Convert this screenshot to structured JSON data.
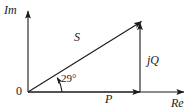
{
  "figure": {
    "type": "phasor-diagram",
    "background_color": "#ffffff",
    "line_color": "#1a1a1a",
    "axes": {
      "vertical_label": "Im",
      "horizontal_label": "Re",
      "origin_label": "0"
    },
    "vectors": [
      {
        "name": "apparent-power",
        "label": "S",
        "from": [
          28,
          92
        ],
        "to": [
          142,
          22
        ],
        "style": "arrow"
      },
      {
        "name": "real-power",
        "label": "P",
        "from": [
          28,
          92
        ],
        "to": [
          141,
          92
        ],
        "style": "arrow"
      },
      {
        "name": "reactive-power",
        "label": "jQ",
        "from": [
          140,
          92
        ],
        "to": [
          140,
          23
        ],
        "style": "arrow"
      }
    ],
    "angle": {
      "name": "power-factor-angle",
      "value": "29",
      "unit": "°",
      "label": "29°",
      "vertex": [
        28,
        92
      ]
    }
  }
}
